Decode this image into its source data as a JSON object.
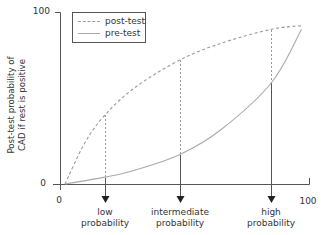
{
  "chart_data": {
    "type": "line",
    "title": "",
    "xlabel": "",
    "ylabel": "Post-test probability of CAD if rest is positive",
    "xlim": [
      0,
      100
    ],
    "ylim": [
      0,
      100
    ],
    "x_ticks": [
      "0",
      "100"
    ],
    "y_ticks": [
      "0",
      "100"
    ],
    "grid": false,
    "legend_position": "upper-left",
    "series": [
      {
        "name": "post-test",
        "style": "dashed",
        "color": "#999999",
        "x": [
          2,
          10,
          18,
          30,
          48,
          65,
          85,
          97
        ],
        "y": [
          0,
          24,
          40,
          56,
          72,
          82,
          90,
          92
        ]
      },
      {
        "name": "pre-test",
        "style": "solid",
        "color": "#aaaaaa",
        "x": [
          2,
          18,
          30,
          48,
          65,
          85,
          97
        ],
        "y": [
          0,
          4,
          8,
          17,
          32,
          59,
          90
        ]
      }
    ],
    "annotations": [
      {
        "label": "low probability",
        "x": 18,
        "post_test": 40,
        "pre_test": 4
      },
      {
        "label": "intermediate probability",
        "x": 48,
        "post_test": 72,
        "pre_test": 17
      },
      {
        "label": "high probability",
        "x": 85,
        "post_test": 90,
        "pre_test": 59
      }
    ]
  },
  "axes": {
    "y_max_label": "100",
    "y_min_label": "0",
    "x_min_label": "0",
    "x_max_label": "100",
    "y_title_line1": "Post-test probability of",
    "y_title_line2": "CAD if rest is positive"
  },
  "legend": {
    "items": [
      {
        "label": "post-test",
        "style": "dashed"
      },
      {
        "label": "pre-test",
        "style": "solid"
      }
    ]
  },
  "markers": [
    {
      "line1": "low",
      "line2": "probability"
    },
    {
      "line1": "intermediate",
      "line2": "probability"
    },
    {
      "line1": "high",
      "line2": "probability"
    }
  ]
}
